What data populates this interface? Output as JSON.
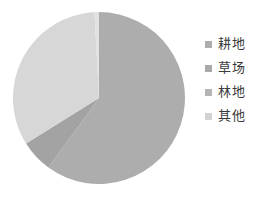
{
  "chart_data": {
    "type": "pie",
    "title": "",
    "subtitle": "",
    "xlabel": "",
    "ylabel": "",
    "grid": false,
    "legend_position": "right",
    "start_angle_deg": 0,
    "direction": "clockwise",
    "center": {
      "x": 99,
      "y": 98
    },
    "radius": 86,
    "categories": [
      "耕地",
      "草场",
      "林地",
      "其他"
    ],
    "values": [
      60,
      6,
      33,
      1
    ],
    "units": "%",
    "colors": [
      "#adadad",
      "#a3a3a3",
      "#d7d7d7",
      "#e2e2e2"
    ],
    "slices": [
      {
        "label": "耕地",
        "value": 60,
        "color": "#adadad",
        "start_deg": 0,
        "end_deg": 216
      },
      {
        "label": "草场",
        "value": 6,
        "color": "#a3a3a3",
        "start_deg": 216,
        "end_deg": 238
      },
      {
        "label": "林地",
        "value": 33,
        "color": "#d7d7d7",
        "start_deg": 238,
        "end_deg": 357
      },
      {
        "label": "其他",
        "value": 1,
        "color": "#e2e2e2",
        "start_deg": 357,
        "end_deg": 360
      }
    ]
  },
  "legend": {
    "items": [
      {
        "label": "耕地",
        "color": "#adadad",
        "marker": "square-marker-icon"
      },
      {
        "label": "草场",
        "color": "#a9a9a9",
        "marker": "square-marker-icon"
      },
      {
        "label": "林地",
        "color": "#b5b5b5",
        "marker": "square-marker-icon"
      },
      {
        "label": "其他",
        "color": "#d2d2d2",
        "marker": "square-marker-icon"
      }
    ]
  },
  "canvas": {
    "background": "#ffffff",
    "width": 259,
    "height": 197
  }
}
